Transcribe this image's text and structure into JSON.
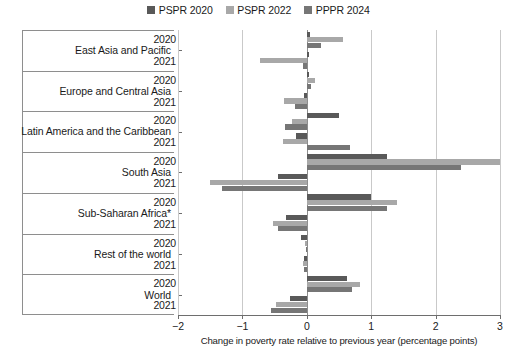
{
  "chart_data": {
    "type": "bar",
    "orientation": "horizontal",
    "title": "",
    "xlabel": "Change in poverty rate relative to previous year (percentage points)",
    "ylabel": "",
    "xlim": [
      -2,
      3
    ],
    "xticks": [
      -2,
      -1,
      0,
      1,
      2,
      3
    ],
    "xticklabels": [
      "−2",
      "−1",
      "0",
      "1",
      "2",
      "3"
    ],
    "grid": "vertical",
    "legend_position": "top-center",
    "colors": {
      "series_0": "#595959",
      "series_1": "#a8a8a8",
      "series_2": "#767676",
      "gridline": "#c9c9c9",
      "axis": "#6e6e6e",
      "background": "#ffffff"
    },
    "legend": [
      {
        "label": "PSPR 2020",
        "color": "#595959"
      },
      {
        "label": "PSPR 2022",
        "color": "#a8a8a8"
      },
      {
        "label": "PPPR 2024",
        "color": "#767676"
      }
    ],
    "series": [
      {
        "name": "PSPR 2020",
        "color": "#595959"
      },
      {
        "name": "PSPR 2022",
        "color": "#a8a8a8"
      },
      {
        "name": "PPPR 2024",
        "color": "#767676"
      }
    ],
    "groups": [
      {
        "category": "East Asia and Pacific",
        "rows": [
          {
            "year": "2020",
            "values": [
              0.05,
              0.56,
              0.22
            ]
          },
          {
            "year": "2021",
            "values": [
              0.04,
              -0.72,
              -0.06
            ]
          }
        ]
      },
      {
        "category": "Europe and Central Asia",
        "rows": [
          {
            "year": "2020",
            "values": [
              0.04,
              0.12,
              0.07
            ]
          },
          {
            "year": "2021",
            "values": [
              -0.04,
              -0.35,
              -0.19
            ]
          }
        ]
      },
      {
        "category": "Latin America and the Caribbean",
        "rows": [
          {
            "year": "2020",
            "values": [
              0.5,
              -0.23,
              -0.34
            ]
          },
          {
            "year": "2021",
            "values": [
              -0.16,
              -0.37,
              0.67
            ]
          }
        ]
      },
      {
        "category": "South Asia",
        "rows": [
          {
            "year": "2020",
            "values": [
              1.24,
              3.0,
              2.4
            ]
          },
          {
            "year": "2021",
            "values": [
              -0.45,
              -1.5,
              -1.32
            ]
          }
        ]
      },
      {
        "category": "Sub-Saharan Africa*",
        "rows": [
          {
            "year": "2020",
            "values": [
              1.0,
              1.4,
              1.24
            ]
          },
          {
            "year": "2021",
            "values": [
              -0.33,
              -0.52,
              -0.45
            ]
          }
        ]
      },
      {
        "category": "Rest of the world",
        "rows": [
          {
            "year": "2020",
            "values": [
              -0.09,
              -0.03,
              -0.02
            ]
          },
          {
            "year": "2021",
            "values": [
              -0.04,
              -0.06,
              -0.05
            ]
          }
        ]
      },
      {
        "category": "World",
        "rows": [
          {
            "year": "2020",
            "values": [
              0.63,
              0.82,
              0.7
            ]
          },
          {
            "year": "2021",
            "values": [
              -0.26,
              -0.48,
              -0.55
            ]
          }
        ]
      }
    ]
  },
  "cut_text": {
    "top_fragment": ""
  }
}
